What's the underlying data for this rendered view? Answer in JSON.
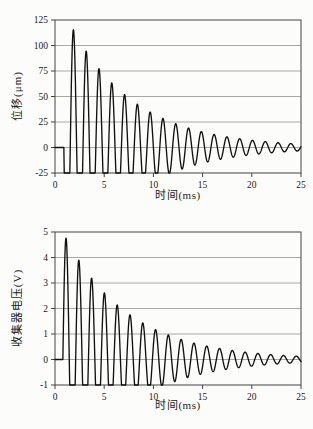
{
  "figure": {
    "background_color": "#fcfcfb",
    "curve_color": "#111111",
    "grid_color": "#6e6e6e",
    "axis_color": "#444444"
  },
  "chart_data": [
    {
      "type": "line",
      "title": "",
      "xlabel": "时间(ms)",
      "ylabel": "位移(μm)",
      "xlim": [
        0,
        25
      ],
      "ylim": [
        -25,
        125
      ],
      "xticks": [
        0,
        5,
        10,
        15,
        20,
        25
      ],
      "yticks": [
        -25,
        0,
        25,
        50,
        75,
        100,
        125
      ],
      "grid": "horizontal",
      "legend": "none",
      "signal": {
        "model": "y=0 for t<t0; y=amplitude*exp(-(t-t0)/tau_ms)*(-sin(2*pi*(t-t0)/period_ms)) clipped to ylim",
        "t0": 0.9,
        "amplitude": 134,
        "tau_ms": 6.5,
        "period_ms": 1.3,
        "inverted": true
      },
      "peak_times_ms": [
        1.9,
        3.2,
        4.5,
        5.8,
        7.1,
        8.4,
        9.6,
        10.9,
        12.2,
        13.5,
        14.8,
        16.1,
        17.4,
        18.7,
        20.0,
        21.3,
        22.6,
        23.9
      ],
      "peak_values": [
        115,
        92,
        74,
        60,
        49,
        40,
        32,
        26,
        21,
        17,
        14,
        11,
        9,
        8,
        6,
        5,
        4,
        3
      ],
      "negative_clip_level": -25
    },
    {
      "type": "line",
      "title": "",
      "xlabel": "时间(ms)",
      "ylabel": "收集器电压(V)",
      "xlim": [
        0,
        25
      ],
      "ylim": [
        -1,
        5
      ],
      "xticks": [
        0,
        5,
        10,
        15,
        20,
        25
      ],
      "yticks": [
        -1,
        0,
        1,
        2,
        3,
        4,
        5
      ],
      "grid": "horizontal",
      "legend": "none",
      "signal": {
        "model": "y=0 for t<t0; y=amplitude*exp(-(t-t0)/tau_ms)*sin(2*pi*(t-t0)/period_ms) clipped to ylim",
        "t0": 0.8,
        "amplitude": 5.0,
        "tau_ms": 6.5,
        "period_ms": 1.3,
        "inverted": false
      },
      "peak_times_ms": [
        1.15,
        2.45,
        3.75,
        5.05,
        6.35,
        7.65,
        8.95,
        10.25,
        11.55,
        12.85,
        14.15,
        15.45,
        16.75,
        18.05,
        19.35,
        20.65,
        21.95,
        23.25
      ],
      "peak_values": [
        4.75,
        3.8,
        3.0,
        2.45,
        2.0,
        1.65,
        1.35,
        1.1,
        0.9,
        0.72,
        0.6,
        0.48,
        0.4,
        0.32,
        0.26,
        0.21,
        0.17,
        0.14
      ],
      "negative_clip_level": -1
    }
  ]
}
